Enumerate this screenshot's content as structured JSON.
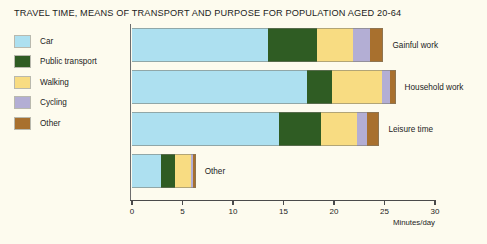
{
  "title": "TRAVEL TIME, MEANS OF TRANSPORT AND PURPOSE FOR POPULATION AGED 20-64",
  "colors": {
    "car": "#ade0f0",
    "public_transport": "#2f5c23",
    "walking": "#f8dc82",
    "cycling": "#b3aed4",
    "other": "#a8702e",
    "background": "#fdfbee",
    "axis": "#4a4a4a"
  },
  "legend": {
    "position": "left",
    "items": [
      {
        "label": "Car",
        "color": "#ade0f0"
      },
      {
        "label": "Public transport",
        "color": "#2f5c23"
      },
      {
        "label": "Walking",
        "color": "#f8dc82"
      },
      {
        "label": "Cycling",
        "color": "#b3aed4"
      },
      {
        "label": "Other",
        "color": "#a8702e"
      }
    ]
  },
  "axis": {
    "x_title": "Minutes/day",
    "ticks": [
      "0",
      "5",
      "10",
      "15",
      "20",
      "25",
      "30"
    ]
  },
  "chart_data": {
    "type": "bar",
    "orientation": "horizontal",
    "stacked": true,
    "title": "TRAVEL TIME, MEANS OF TRANSPORT AND PURPOSE FOR POPULATION AGED 20-64",
    "xlabel": "Minutes/day",
    "ylabel": "",
    "xlim": [
      0,
      30
    ],
    "xticks": [
      0,
      5,
      10,
      15,
      20,
      25,
      30
    ],
    "grid": false,
    "legend_position": "left",
    "categories": [
      "Gainful work",
      "Household work",
      "Leisure time",
      "Other"
    ],
    "series": [
      {
        "name": "Car",
        "color": "#ade0f0",
        "values": [
          13.5,
          17.3,
          14.6,
          2.9
        ]
      },
      {
        "name": "Public transport",
        "color": "#2f5c23",
        "values": [
          4.8,
          2.5,
          4.1,
          1.4
        ]
      },
      {
        "name": "Walking",
        "color": "#f8dc82",
        "values": [
          3.6,
          5.0,
          3.6,
          1.5
        ]
      },
      {
        "name": "Cycling",
        "color": "#b3aed4",
        "values": [
          1.7,
          0.7,
          1.0,
          0.2
        ]
      },
      {
        "name": "Other",
        "color": "#a8702e",
        "values": [
          1.3,
          0.6,
          1.2,
          0.3
        ]
      }
    ],
    "totals": [
      24.9,
      26.1,
      24.5,
      6.3
    ]
  },
  "bars": [
    {
      "label": "Gainful work",
      "segments": [
        {
          "name": "Car",
          "value": 13.5,
          "color": "#ade0f0"
        },
        {
          "name": "Public transport",
          "value": 4.8,
          "color": "#2f5c23"
        },
        {
          "name": "Walking",
          "value": 3.6,
          "color": "#f8dc82"
        },
        {
          "name": "Cycling",
          "value": 1.7,
          "color": "#b3aed4"
        },
        {
          "name": "Other",
          "value": 1.3,
          "color": "#a8702e"
        }
      ]
    },
    {
      "label": "Household work",
      "segments": [
        {
          "name": "Car",
          "value": 17.3,
          "color": "#ade0f0"
        },
        {
          "name": "Public transport",
          "value": 2.5,
          "color": "#2f5c23"
        },
        {
          "name": "Walking",
          "value": 5.0,
          "color": "#f8dc82"
        },
        {
          "name": "Cycling",
          "value": 0.7,
          "color": "#b3aed4"
        },
        {
          "name": "Other",
          "value": 0.6,
          "color": "#a8702e"
        }
      ]
    },
    {
      "label": "Leisure time",
      "segments": [
        {
          "name": "Car",
          "value": 14.6,
          "color": "#ade0f0"
        },
        {
          "name": "Public transport",
          "value": 4.1,
          "color": "#2f5c23"
        },
        {
          "name": "Walking",
          "value": 3.6,
          "color": "#f8dc82"
        },
        {
          "name": "Cycling",
          "value": 1.0,
          "color": "#b3aed4"
        },
        {
          "name": "Other",
          "value": 1.2,
          "color": "#a8702e"
        }
      ]
    },
    {
      "label": "Other",
      "segments": [
        {
          "name": "Car",
          "value": 2.9,
          "color": "#ade0f0"
        },
        {
          "name": "Public transport",
          "value": 1.4,
          "color": "#2f5c23"
        },
        {
          "name": "Walking",
          "value": 1.5,
          "color": "#f8dc82"
        },
        {
          "name": "Cycling",
          "value": 0.2,
          "color": "#b3aed4"
        },
        {
          "name": "Other",
          "value": 0.3,
          "color": "#a8702e"
        }
      ]
    }
  ]
}
